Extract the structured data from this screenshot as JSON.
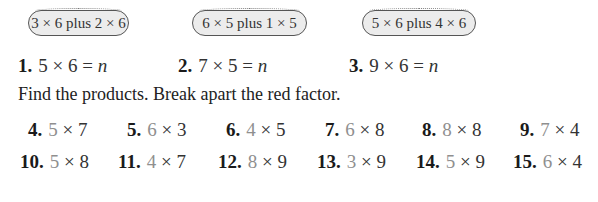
{
  "hint_bubbles": [
    {
      "text": "3 × 6 plus 2 × 6"
    },
    {
      "text": "6 × 5 plus 1 × 5"
    },
    {
      "text": "5 × 6 plus 4 × 6"
    }
  ],
  "problems": [
    {
      "number": "1.",
      "a": "5",
      "b": "6",
      "eq": "=",
      "var": "n"
    },
    {
      "number": "2.",
      "a": "7",
      "b": "5",
      "eq": "=",
      "var": "n"
    },
    {
      "number": "3.",
      "a": "9",
      "b": "6",
      "eq": "=",
      "var": "n"
    }
  ],
  "instruction": "Find the products. Break apart the red factor.",
  "exercises": [
    {
      "number": "4.",
      "red": "5",
      "other": "7"
    },
    {
      "number": "5.",
      "red": "6",
      "other": "3"
    },
    {
      "number": "6.",
      "red": "4",
      "other": "5"
    },
    {
      "number": "7.",
      "red": "6",
      "other": "8"
    },
    {
      "number": "8.",
      "red": "8",
      "other": "8"
    },
    {
      "number": "9.",
      "red": "7",
      "other": "4"
    },
    {
      "number": "10.",
      "red": "5",
      "other": "8"
    },
    {
      "number": "11.",
      "red": "4",
      "other": "7"
    },
    {
      "number": "12.",
      "red": "8",
      "other": "9"
    },
    {
      "number": "13.",
      "red": "3",
      "other": "9"
    },
    {
      "number": "14.",
      "red": "5",
      "other": "9"
    },
    {
      "number": "15.",
      "red": "6",
      "other": "4"
    }
  ],
  "symbols": {
    "times": "×"
  },
  "colors": {
    "red_factor": "#8f8f8f",
    "bubble_fill": "#ececec",
    "text": "#222222"
  }
}
